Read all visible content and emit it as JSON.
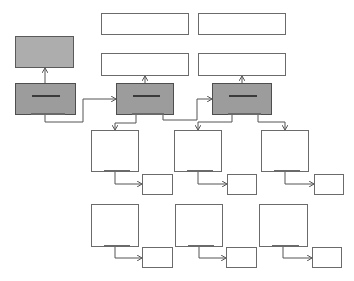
{
  "diagram": {
    "title": "",
    "colors": {
      "background": "#ffffff",
      "border": "#6b6b6b",
      "dark_fill": "#9c9c9c",
      "mid_fill": "#adadad",
      "connector": "#555555"
    },
    "nodes": [
      {
        "id": "top-a1",
        "kind": "white",
        "x": 101,
        "y": 13,
        "w": 88,
        "h": 22,
        "label": ""
      },
      {
        "id": "top-a2",
        "kind": "white",
        "x": 198,
        "y": 13,
        "w": 88,
        "h": 22,
        "label": ""
      },
      {
        "id": "top-b1",
        "kind": "white",
        "x": 101,
        "y": 53,
        "w": 88,
        "h": 23,
        "label": ""
      },
      {
        "id": "top-b2",
        "kind": "white",
        "x": 198,
        "y": 53,
        "w": 88,
        "h": 23,
        "label": ""
      },
      {
        "id": "left-upper",
        "kind": "mid",
        "x": 15,
        "y": 36,
        "w": 59,
        "h": 32,
        "label": ""
      },
      {
        "id": "left-lower",
        "kind": "dark",
        "x": 15,
        "y": 83,
        "w": 61,
        "h": 32,
        "label": "",
        "bar": true,
        "foot": true
      },
      {
        "id": "center",
        "kind": "dark",
        "x": 116,
        "y": 83,
        "w": 58,
        "h": 32,
        "label": "",
        "bar": true,
        "foot": true
      },
      {
        "id": "right",
        "kind": "dark",
        "x": 212,
        "y": 83,
        "w": 60,
        "h": 32,
        "label": "",
        "bar": true,
        "foot": true
      },
      {
        "id": "row1-c1",
        "kind": "white",
        "x": 91,
        "y": 130,
        "w": 48,
        "h": 42,
        "label": "",
        "foot": true
      },
      {
        "id": "row1-c2",
        "kind": "white",
        "x": 174,
        "y": 130,
        "w": 48,
        "h": 42,
        "label": "",
        "foot": true
      },
      {
        "id": "row1-c3",
        "kind": "white",
        "x": 261,
        "y": 130,
        "w": 48,
        "h": 42,
        "label": "",
        "foot": true
      },
      {
        "id": "row1-s1",
        "kind": "white",
        "x": 142,
        "y": 174,
        "w": 31,
        "h": 21,
        "label": ""
      },
      {
        "id": "row1-s2",
        "kind": "white",
        "x": 227,
        "y": 174,
        "w": 30,
        "h": 21,
        "label": ""
      },
      {
        "id": "row1-s3",
        "kind": "white",
        "x": 314,
        "y": 174,
        "w": 30,
        "h": 21,
        "label": ""
      },
      {
        "id": "row2-c1",
        "kind": "white",
        "x": 91,
        "y": 204,
        "w": 48,
        "h": 43,
        "label": "",
        "foot": true
      },
      {
        "id": "row2-c2",
        "kind": "white",
        "x": 175,
        "y": 204,
        "w": 48,
        "h": 43,
        "label": "",
        "foot": true
      },
      {
        "id": "row2-c3",
        "kind": "white",
        "x": 259,
        "y": 204,
        "w": 49,
        "h": 43,
        "label": "",
        "foot": true
      },
      {
        "id": "row2-s1",
        "kind": "white",
        "x": 142,
        "y": 247,
        "w": 31,
        "h": 21,
        "label": ""
      },
      {
        "id": "row2-s2",
        "kind": "white",
        "x": 226,
        "y": 247,
        "w": 31,
        "h": 21,
        "label": ""
      },
      {
        "id": "row2-s3",
        "kind": "white",
        "x": 312,
        "y": 247,
        "w": 30,
        "h": 21,
        "label": ""
      }
    ],
    "connectors": [
      {
        "from": "left-lower",
        "to": "left-upper",
        "points": [
          [
            45,
            83
          ],
          [
            45,
            68
          ]
        ]
      },
      {
        "from": "left-lower",
        "to": "center",
        "points": [
          [
            45,
            115
          ],
          [
            45,
            122
          ],
          [
            83,
            122
          ],
          [
            83,
            99
          ],
          [
            116,
            99
          ]
        ]
      },
      {
        "from": "center",
        "to": "top-b1",
        "points": [
          [
            145,
            83
          ],
          [
            145,
            76
          ]
        ]
      },
      {
        "from": "right",
        "to": "top-b2",
        "points": [
          [
            242,
            83
          ],
          [
            242,
            76
          ]
        ]
      },
      {
        "from": "center",
        "to": "right",
        "points": [
          [
            163,
            115
          ],
          [
            163,
            120
          ],
          [
            197,
            120
          ],
          [
            197,
            99
          ],
          [
            212,
            99
          ]
        ]
      },
      {
        "from": "center",
        "to": "row1-c1",
        "points": [
          [
            136,
            115
          ],
          [
            136,
            123
          ],
          [
            115,
            123
          ],
          [
            115,
            130
          ]
        ]
      },
      {
        "from": "right",
        "to": "row1-c2",
        "points": [
          [
            232,
            115
          ],
          [
            232,
            122
          ],
          [
            198,
            122
          ],
          [
            198,
            130
          ]
        ]
      },
      {
        "from": "right",
        "to": "row1-c3",
        "points": [
          [
            258,
            115
          ],
          [
            258,
            122
          ],
          [
            285,
            122
          ],
          [
            285,
            130
          ]
        ]
      },
      {
        "from": "row1-c1",
        "to": "row1-s1",
        "points": [
          [
            115,
            172
          ],
          [
            115,
            184
          ],
          [
            142,
            184
          ]
        ]
      },
      {
        "from": "row1-c2",
        "to": "row1-s2",
        "points": [
          [
            198,
            172
          ],
          [
            198,
            184
          ],
          [
            227,
            184
          ]
        ]
      },
      {
        "from": "row1-c3",
        "to": "row1-s3",
        "points": [
          [
            285,
            172
          ],
          [
            285,
            184
          ],
          [
            314,
            184
          ]
        ]
      },
      {
        "from": "row2-c1",
        "to": "row2-s1",
        "points": [
          [
            115,
            247
          ],
          [
            115,
            258
          ],
          [
            142,
            258
          ]
        ]
      },
      {
        "from": "row2-c2",
        "to": "row2-s2",
        "points": [
          [
            199,
            247
          ],
          [
            199,
            258
          ],
          [
            226,
            258
          ]
        ]
      },
      {
        "from": "row2-c3",
        "to": "row2-s3",
        "points": [
          [
            283,
            247
          ],
          [
            283,
            258
          ],
          [
            312,
            258
          ]
        ]
      }
    ]
  }
}
